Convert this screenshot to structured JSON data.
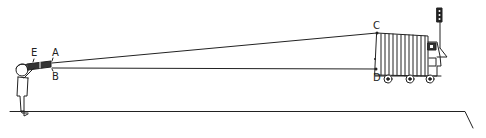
{
  "labels": {
    "E": "E",
    "A": "A",
    "B": "B",
    "C": "C",
    "D": "D"
  },
  "figure": {
    "stroke_color": "#222222",
    "background": "#ffffff"
  }
}
